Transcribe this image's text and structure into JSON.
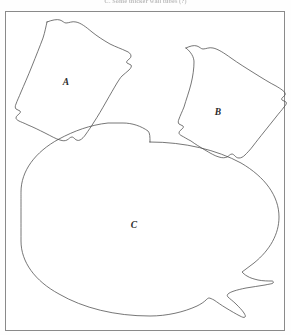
{
  "figure": {
    "caption_partial": "C.  Some thicker wall tubes (?)",
    "frame": {
      "border_color": "#8a8a8a",
      "fill_color": "#ffffff",
      "x": 5,
      "y": 11,
      "width": 280,
      "height": 320
    },
    "line_color": "#4a4a4a",
    "background_color": "#fefefe",
    "shapes": [
      {
        "id": "shape-a",
        "label": "A",
        "kind": "rounded-quadrilateral-blob",
        "label_x": 66,
        "label_y": 85,
        "path": "M 47,22 C 52,20 57,19 60,20 C 63,21 64,23 66,23 C 69,23 72,21 76,22 C 81,23 86,27 92,32 C 97,36 103,40 110,44 C 116,47 122,49 126,51 C 129,52 131,54 131,56 C 131,58 129,59 128,60 C 127,61 126,62 127,63 C 128,64 130,64 131,65 C 132,66 131,68 129,70 C 127,72 124,74 122,76 C 120,78 119,80 117,83 C 114,88 110,95 106,102 C 102,109 98,116 94,122 C 91,127 88,131 86,134 C 84,137 82,139 80,140 C 78,141 76,140 75,139 C 74,138 73,137 72,137 C 70,137 69,139 67,140 C 65,141 63,141 60,140 C 56,139 51,136 45,133 C 39,130 33,127 28,125 C 24,123 21,122 19,121 C 17,120 16,119 16,118 C 16,116 18,115 19,114 C 20,113 21,112 20,111 C 19,110 17,110 16,109 C 15,108 15,106 16,104 C 17,101 19,97 21,92 C 24,85 28,76 32,66 C 36,56 40,46 43,38 C 45,32 46,26 47,22 Z"
      },
      {
        "id": "shape-b",
        "label": "B",
        "kind": "rounded-quadrilateral-blob",
        "label_x": 218,
        "label_y": 115,
        "path": "M 186,48 C 190,46 194,45 197,46 C 200,47 201,49 203,49 C 206,49 209,47 213,48 C 218,49 224,53 231,58 C 238,63 246,68 254,73 C 262,78 270,83 276,86 C 281,89 284,91 285,93 C 286,95 284,96 283,97 C 282,98 281,99 282,100 C 283,101 285,101 286,102 C 287,103 286,105 284,107 C 282,110 279,113 276,117 C 272,122 268,127 264,132 C 260,137 256,142 253,146 C 250,150 247,153 245,155 C 243,157 241,158 239,158 C 237,158 236,157 235,156 C 234,155 233,154 232,154 C 230,154 229,156 227,157 C 225,158 222,158 219,157 C 215,156 210,153 205,150 C 200,147 195,144 191,141 C 187,139 184,137 182,136 C 180,135 179,134 179,133 C 179,131 181,130 182,129 C 183,128 184,127 183,126 C 182,125 180,125 179,124 C 178,123 178,121 179,119 C 180,116 182,112 184,107 C 186,100 189,92 191,84 C 193,76 194,68 194,62 C 194,57 191,52 186,48 Z"
      },
      {
        "id": "shape-c",
        "label": "C",
        "kind": "large-oval-with-tail",
        "label_x": 134,
        "label_y": 228,
        "path": "M 150,142 C 185,142 217,150 241,163 C 265,177 279,196 279,217 C 279,234 270,250 254,263 C 250,266 246,269 242,272 C 243,273 245,275 247,276 C 250,278 254,279 258,280 C 263,281 268,281 272,281 C 273,281 274,282 273,283 C 272,284 269,284 265,285 C 259,286 252,287 246,288 C 241,289 237,290 234,291 C 231,292 229,293 228,294 C 227,295 227,296 228,297 C 230,299 233,301 236,304 C 239,307 242,310 244,313 C 245,315 246,316 245,317 C 244,318 242,317 240,316 C 236,314 231,311 226,308 C 221,305 217,302 214,300 C 212,299 210,298 209,298 C 208,298 207,299 206,300 C 204,302 201,304 197,306 C 184,312 167,316 150,316 C 115,316 83,308 59,294 C 35,281 21,262 21,241 C 21,217 21,192 21,192 C 21,171 35,152 59,139 C 74,131 90,125 108,123 C 113,123 118,123 123,123 C 132,123 141,126 148,131 C 150,133 150,137 150,142 Z"
      }
    ]
  }
}
